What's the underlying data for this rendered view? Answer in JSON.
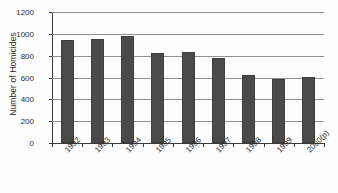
{
  "chart_data": {
    "type": "bar",
    "title": "",
    "xlabel": "",
    "ylabel": "Number of Homicides",
    "categories": [
      "1992",
      "1993",
      "1994",
      "1995",
      "1996",
      "1997",
      "1998",
      "1999",
      "2000(p)"
    ],
    "values": [
      945,
      952,
      978,
      828,
      830,
      778,
      625,
      590,
      605
    ],
    "ylim": [
      0,
      1200
    ],
    "ytick_labels": [
      "0",
      "200",
      "400",
      "600",
      "800",
      "1000",
      "1200"
    ],
    "ytick_values": [
      0,
      200,
      400,
      600,
      800,
      1000,
      1200
    ],
    "grid": "horizontal",
    "legend": "none",
    "series": [
      {
        "name": "Number of Homicides",
        "color": "#4a4a4a",
        "values": [
          945,
          952,
          978,
          828,
          830,
          778,
          625,
          590,
          605
        ]
      }
    ]
  },
  "style": {
    "bar_color": "#4a4a4a",
    "gridline_color": "#8f8f8f",
    "axis_color": "#3a3a3a",
    "background": "#fdfdfd",
    "text_color": "#2b2b2b"
  }
}
